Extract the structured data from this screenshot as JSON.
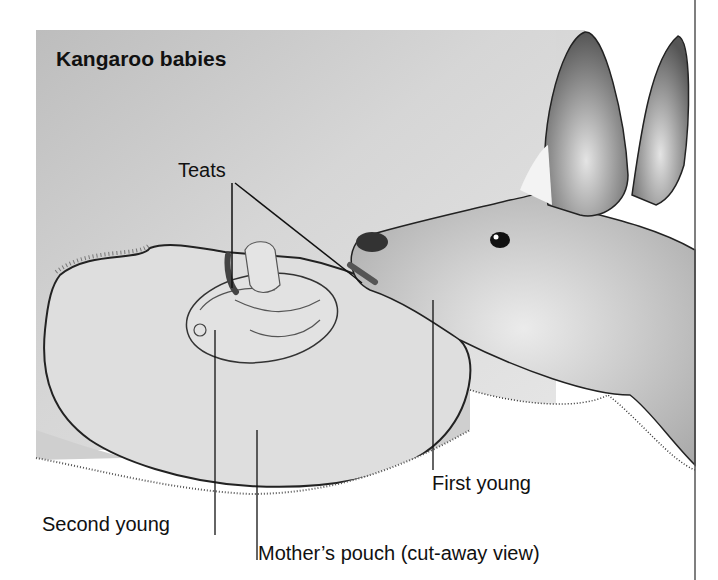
{
  "figure": {
    "title": "Kangaroo babies",
    "labels": {
      "teats": "Teats",
      "first_young": "First young",
      "second_young": "Second young",
      "mothers_pouch": "Mother’s pouch (cut-away view)"
    },
    "colors": {
      "background_gray": "#cfcfcf",
      "pouch_fill": "#dcdcdc",
      "ink": "#111111",
      "page": "#ffffff"
    }
  }
}
